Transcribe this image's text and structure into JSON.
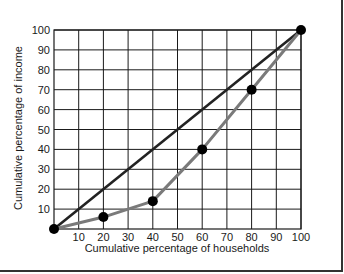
{
  "chart_data": {
    "type": "line",
    "title": "",
    "xlabel": "Cumulative percentage of households",
    "ylabel": "Cumulative percentage of income",
    "xlim": [
      0,
      100
    ],
    "ylim": [
      0,
      100
    ],
    "x_ticks": [
      10,
      20,
      30,
      40,
      50,
      60,
      70,
      80,
      90,
      100
    ],
    "y_ticks": [
      10,
      20,
      30,
      40,
      50,
      60,
      70,
      80,
      90,
      100
    ],
    "grid": true,
    "legend": null,
    "series": [
      {
        "name": "Line of equality",
        "color": "#222222",
        "x": [
          0,
          100
        ],
        "y": [
          0,
          100
        ],
        "markers": false
      },
      {
        "name": "Lorenz curve",
        "color": "#7a7a7a",
        "x": [
          0,
          20,
          40,
          60,
          80,
          100
        ],
        "y": [
          0,
          6,
          14,
          40,
          70,
          100
        ],
        "markers": true,
        "marker_color": "#000000"
      }
    ]
  },
  "colors": {
    "grid": "#1a1a1a",
    "equality_line": "#222222",
    "lorenz_line": "#7a7a7a",
    "marker": "#000000",
    "frame": "#333333"
  }
}
